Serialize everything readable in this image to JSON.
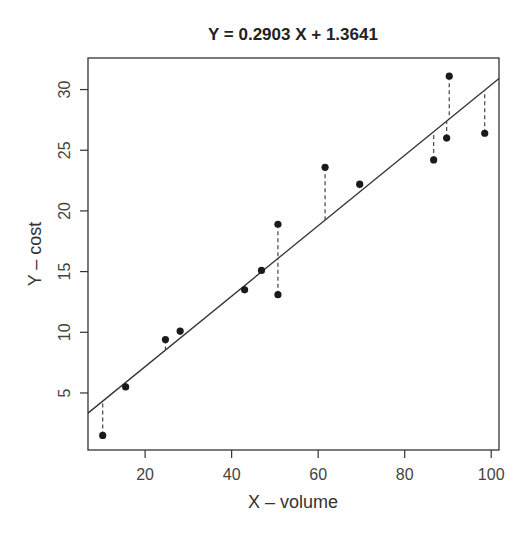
{
  "chart_data": {
    "type": "scatter",
    "title": "Y = 0.2903 X + 1.3641",
    "xlabel": "X – volume",
    "ylabel": "Y – cost",
    "xlim": [
      6.8,
      101.8
    ],
    "ylim": [
      0.3,
      32.6
    ],
    "xticks": [
      20,
      40,
      60,
      80,
      100
    ],
    "yticks": [
      5,
      10,
      15,
      20,
      25,
      30
    ],
    "grid": false,
    "legend": null,
    "regression": {
      "slope": 0.2903,
      "intercept": 1.3641
    },
    "residual_lines": "dashed",
    "points": [
      {
        "x": 10.2,
        "y": 1.5
      },
      {
        "x": 15.5,
        "y": 5.5
      },
      {
        "x": 24.7,
        "y": 9.4
      },
      {
        "x": 28.1,
        "y": 10.1
      },
      {
        "x": 43.0,
        "y": 13.5
      },
      {
        "x": 46.9,
        "y": 15.1
      },
      {
        "x": 50.7,
        "y": 18.9
      },
      {
        "x": 50.7,
        "y": 13.1
      },
      {
        "x": 61.6,
        "y": 23.6
      },
      {
        "x": 69.6,
        "y": 22.2
      },
      {
        "x": 86.7,
        "y": 24.2
      },
      {
        "x": 89.7,
        "y": 26.0
      },
      {
        "x": 90.3,
        "y": 31.1
      },
      {
        "x": 98.5,
        "y": 26.4
      }
    ]
  },
  "colors": {
    "axis": "#333333",
    "point": "#1a1a1a",
    "line": "#333333"
  }
}
